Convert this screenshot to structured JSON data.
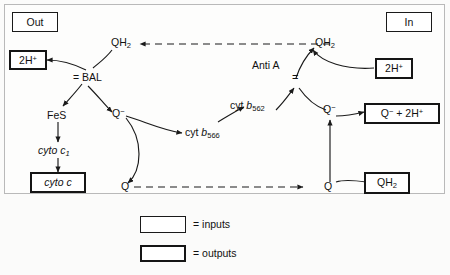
{
  "diagram": {
    "type": "flow-diagram",
    "colors": {
      "background": "#fbfbfa",
      "stroke": "#1a1a1a",
      "box_fill": "#ffffff",
      "frame": "#b9b9b9"
    }
  },
  "compartments": {
    "out_label": "Out",
    "in_label": "In"
  },
  "boxes": {
    "out": {
      "label": "Out",
      "style": "inputs"
    },
    "in": {
      "label": "In",
      "style": "inputs"
    },
    "proton_out": {
      "label": "2H+",
      "style": "outputs"
    },
    "proton_in": {
      "label": "2H+",
      "style": "inputs"
    },
    "cyto_c": {
      "label": "cyto c",
      "style": "outputs"
    },
    "q_minus_2h": {
      "label": "Q- + 2H+",
      "style": "outputs"
    },
    "qh2_input": {
      "label": "QH2",
      "style": "inputs"
    }
  },
  "nodes": {
    "qh2_left": "QH2",
    "qh2_right": "QH2",
    "bal": "= BAL",
    "anti_a": "Anti A",
    "fes": "FeS",
    "q_minus_left": "Q−",
    "q_minus_right": "Q−",
    "cyt_b566": "cyt b566",
    "cyt_b562": "cyt b562",
    "cyto_c1": "cyto c1",
    "q_bottom_left": "Q",
    "q_bottom_right": "Q"
  },
  "legend": {
    "rows": [
      {
        "border": "thin",
        "text": "= inputs"
      },
      {
        "border": "thick",
        "text": "= outputs"
      }
    ]
  }
}
